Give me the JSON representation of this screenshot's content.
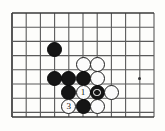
{
  "figure": {
    "kind": "go-board-diagram",
    "caption": "",
    "board": {
      "origin_x": 12,
      "origin_y": 13,
      "spacing": 14.2,
      "cols": 11,
      "rows": 8,
      "line_color": "#5a5a5a",
      "border_color": "#3a3a3a",
      "background": "#fdfdfb",
      "bottom_edge_y": 117
    },
    "star_points": [
      {
        "name": "hoshi-right",
        "col": 9,
        "row": 4.6
      }
    ],
    "stones": [
      {
        "id": "b-lone",
        "color": "black",
        "col": 3,
        "row": 2.55,
        "label": "",
        "marker": ""
      },
      {
        "id": "w-top-left",
        "color": "white",
        "col": 5,
        "row": 3.6,
        "label": "",
        "marker": ""
      },
      {
        "id": "w-top-right",
        "color": "white",
        "col": 6,
        "row": 3.6,
        "label": "",
        "marker": ""
      },
      {
        "id": "b-mid-1",
        "color": "black",
        "col": 3,
        "row": 4.6,
        "label": "",
        "marker": ""
      },
      {
        "id": "b-mid-2",
        "color": "black",
        "col": 4,
        "row": 4.6,
        "label": "",
        "marker": ""
      },
      {
        "id": "b-mid-3",
        "color": "black",
        "col": 5,
        "row": 4.6,
        "label": "",
        "marker": ""
      },
      {
        "id": "w-mid-right",
        "color": "white",
        "col": 6,
        "row": 4.6,
        "label": "",
        "marker": ""
      },
      {
        "id": "b-low-left",
        "color": "black",
        "col": 4,
        "row": 5.6,
        "label": "",
        "marker": ""
      },
      {
        "id": "w-move-1",
        "color": "white",
        "col": 5,
        "row": 5.6,
        "label": "1",
        "marker": ""
      },
      {
        "id": "b-marked",
        "color": "black",
        "col": 6,
        "row": 5.6,
        "label": "",
        "marker": "circle"
      },
      {
        "id": "w-far-right",
        "color": "white",
        "col": 7,
        "row": 5.6,
        "label": "",
        "marker": ""
      },
      {
        "id": "w-move-3",
        "color": "white",
        "col": 4,
        "row": 6.6,
        "label": "3",
        "marker": ""
      },
      {
        "id": "b-bottom",
        "color": "black",
        "col": 5,
        "row": 6.6,
        "label": "",
        "marker": ""
      },
      {
        "id": "w-bottom",
        "color": "white",
        "col": 6,
        "row": 6.6,
        "label": "",
        "marker": ""
      }
    ],
    "stone_diameter": 15
  }
}
